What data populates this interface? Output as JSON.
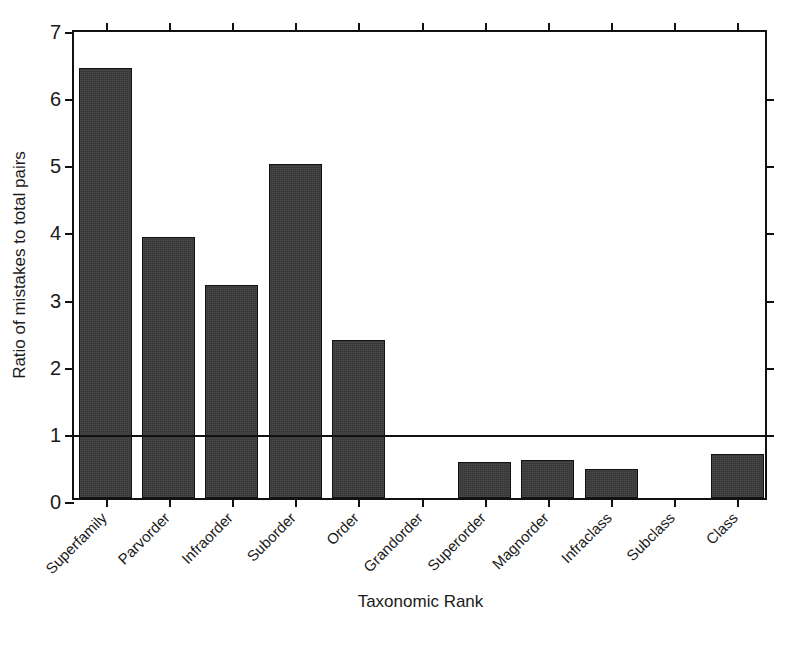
{
  "chart_data": {
    "type": "bar",
    "title": "",
    "xlabel": "Taxonomic Rank",
    "ylabel": "Ratio of mistakes to total pairs",
    "categories": [
      "Superfamily",
      "Parvorder",
      "Infraorder",
      "Suborder",
      "Order",
      "Grandorder",
      "Superorder",
      "Magnorder",
      "Infraclass",
      "Subclass",
      "Class"
    ],
    "values": [
      6.4,
      3.89,
      3.18,
      4.97,
      2.35,
      0.0,
      0.53,
      0.56,
      0.43,
      0.0,
      0.65
    ],
    "ylim": [
      0,
      7
    ],
    "yticks": [
      0,
      1,
      2,
      3,
      4,
      5,
      6,
      7
    ],
    "ytick_labels": [
      "0",
      "1",
      "2",
      "3",
      "4",
      "5",
      "6",
      "7"
    ],
    "grid": false,
    "legend": null,
    "annotations": [
      {
        "name": "reference-line",
        "type": "hline",
        "y": 1.0,
        "label": ""
      }
    ],
    "bar_color": "#3b3b3b",
    "bar_edge_color": "#121212",
    "axis_color": "#111111",
    "background_color": "#ffffff",
    "xtick_label_rotation": 45
  },
  "axes": {
    "y_title": "Ratio of mistakes to total pairs",
    "x_title": "Taxonomic Rank"
  }
}
